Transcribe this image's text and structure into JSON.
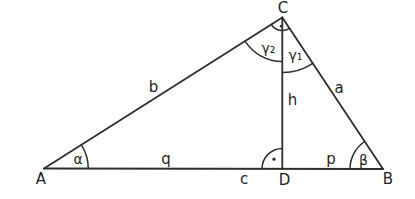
{
  "diagram": {
    "colors": {
      "line": "#2e2e2e",
      "background": "#ffffff",
      "text": "#1f1f1f"
    },
    "labels": {
      "vertex_a": "A",
      "vertex_b": "B",
      "vertex_c": "C",
      "vertex_d": "D",
      "side_a": "a",
      "side_b": "b",
      "side_c": "c",
      "altitude_h": "h",
      "segment_p": "p",
      "segment_q": "q",
      "angle_alpha": "α",
      "angle_beta": "β",
      "angle_gamma1": "γ₁",
      "angle_gamma2": "γ₂"
    },
    "right_angle_dot_markers": [
      "C",
      "D"
    ]
  }
}
